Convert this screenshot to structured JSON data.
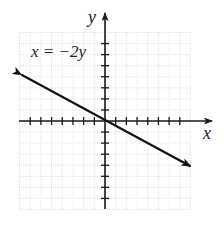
{
  "chart_data": {
    "type": "line",
    "title": "",
    "equation_label": "x = −2y",
    "xlabel": "x",
    "ylabel": "y",
    "xlim": [
      -8,
      8
    ],
    "ylim": [
      -8,
      8
    ],
    "grid": true,
    "tick_marks": {
      "x": [
        -7,
        -6,
        -5,
        -4,
        -3,
        -2,
        -1,
        1,
        2,
        3,
        4,
        5,
        6,
        7
      ],
      "y": [
        -7,
        -6,
        -5,
        -4,
        -3,
        -2,
        -1,
        1,
        2,
        3,
        4,
        5,
        6,
        7
      ]
    },
    "tick_labels_shown": false,
    "series": [
      {
        "name": "x = −2y",
        "x": [
          -8,
          8
        ],
        "y": [
          4,
          -4
        ],
        "arrows": "both"
      }
    ]
  },
  "labels": {
    "equation": "x = −2y",
    "x_axis": "x",
    "y_axis": "y"
  }
}
